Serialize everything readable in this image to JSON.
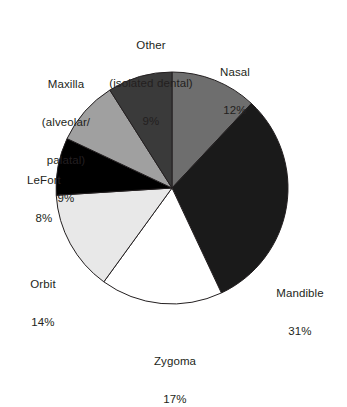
{
  "chart_data": {
    "type": "pie",
    "title": "",
    "subtitle": "",
    "xlabel": "",
    "ylabel": "",
    "legend_position": "none",
    "grid": false,
    "start_angle_deg": 0,
    "direction": "clockwise",
    "unit": "%",
    "categories": [
      "Nasal",
      "Mandible",
      "Zygoma",
      "Orbit",
      "LeFort",
      "Maxilla (alveolar/palatal)",
      "Other (isolated dental)"
    ],
    "values": [
      12,
      31,
      17,
      14,
      8,
      9,
      9
    ],
    "slices": [
      {
        "key": "nasal",
        "label_lines": [
          "Nasal"
        ],
        "value": 12,
        "value_text": "12%",
        "color": "#6e6e6e",
        "stroke": "#231f20"
      },
      {
        "key": "mandible",
        "label_lines": [
          "Mandible"
        ],
        "value": 31,
        "value_text": "31%",
        "color": "#1a1a1a",
        "stroke": "#231f20"
      },
      {
        "key": "zygoma",
        "label_lines": [
          "Zygoma"
        ],
        "value": 17,
        "value_text": "17%",
        "color": "#ffffff",
        "stroke": "#231f20"
      },
      {
        "key": "orbit",
        "label_lines": [
          "Orbit"
        ],
        "value": 14,
        "value_text": "14%",
        "color": "#e8e8e8",
        "stroke": "#231f20"
      },
      {
        "key": "lefort",
        "label_lines": [
          "LeFort"
        ],
        "value": 8,
        "value_text": "8%",
        "color": "#000000",
        "stroke": "#231f20"
      },
      {
        "key": "maxilla",
        "label_lines": [
          "Maxilla",
          "(alveolar/",
          "palatal)"
        ],
        "value": 9,
        "value_text": "9%",
        "color": "#a0a0a0",
        "stroke": "#231f20"
      },
      {
        "key": "other",
        "label_lines": [
          "Other",
          "(isolated dental)"
        ],
        "value": 9,
        "value_text": "9%",
        "color": "#3a3a3a",
        "stroke": "#231f20"
      }
    ]
  },
  "labels": {
    "nasal": {
      "line1": "Nasal",
      "pct": "12%"
    },
    "mandible": {
      "line1": "Mandible",
      "pct": "31%"
    },
    "zygoma": {
      "line1": "Zygoma",
      "pct": "17%"
    },
    "orbit": {
      "line1": "Orbit",
      "pct": "14%"
    },
    "lefort": {
      "line1": "LeFort",
      "pct": "8%"
    },
    "maxilla": {
      "line1": "Maxilla",
      "line2": "(alveolar/",
      "line3": "palatal)",
      "pct": "9%"
    },
    "other": {
      "line1": "Other",
      "line2": "(isolated dental)",
      "pct": "9%"
    }
  }
}
